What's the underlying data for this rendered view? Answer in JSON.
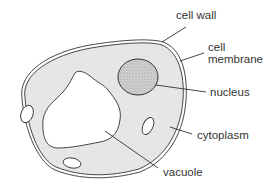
{
  "diagram": {
    "labels": {
      "cell_wall": "cell wall",
      "cell_membrane_line1": "cell",
      "cell_membrane_line2": "membrane",
      "nucleus": "nucleus",
      "cytoplasm": "cytoplasm",
      "vacuole": "vacuole"
    },
    "colors": {
      "cytoplasm": "#e6e6e6",
      "nucleus": "#bdbdbd",
      "outline": "#333333",
      "background": "#ffffff"
    }
  }
}
